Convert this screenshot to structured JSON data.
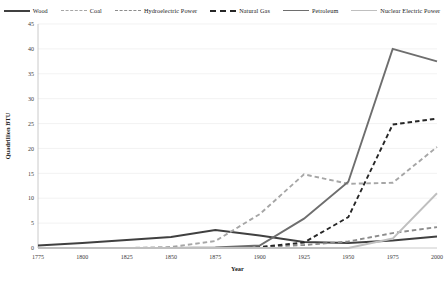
{
  "legend": {
    "items": [
      {
        "label": "Wood",
        "color": "#404040",
        "dash": "none",
        "width": 2
      },
      {
        "label": "Coal",
        "color": "#a6a6a6",
        "dash": "dashed",
        "width": 1.6
      },
      {
        "label": "Hydroelectric Power",
        "color": "#8c8c8c",
        "dash": "dashed",
        "width": 1.6
      },
      {
        "label": "Natural Gas",
        "color": "#262626",
        "dash": "dashed",
        "width": 2.2
      },
      {
        "label": "Petroleum",
        "color": "#6e6e6e",
        "dash": "none",
        "width": 1.8
      },
      {
        "label": "Nuclear Electric Power",
        "color": "#bfbfbf",
        "dash": "none",
        "width": 1.8
      }
    ]
  },
  "axes": {
    "xlabel": "Year",
    "ylabel": "Quadrillion BTU",
    "xticks": [
      "1775",
      "1800",
      "1825",
      "1850",
      "1875",
      "1900",
      "1925",
      "1950",
      "1975",
      "2000"
    ],
    "yticks": [
      "0",
      "5",
      "10",
      "15",
      "20",
      "25",
      "30",
      "35",
      "40",
      "45"
    ]
  },
  "caption": {
    "text": ""
  },
  "chart_data": {
    "type": "line",
    "title": "",
    "xlabel": "Year",
    "ylabel": "Quadrillion BTU",
    "xlim": [
      1775,
      2000
    ],
    "ylim": [
      0,
      45
    ],
    "grid": true,
    "legend_position": "top",
    "x": [
      1775,
      1800,
      1825,
      1850,
      1875,
      1900,
      1925,
      1950,
      1975,
      2000
    ],
    "series": [
      {
        "name": "Wood",
        "color": "#404040",
        "dash": "none",
        "values": [
          0.5,
          1.0,
          1.6,
          2.2,
          3.6,
          2.5,
          1.2,
          1.0,
          1.5,
          2.3
        ]
      },
      {
        "name": "Coal",
        "color": "#a6a6a6",
        "dash": "dashed",
        "values": [
          0.0,
          0.0,
          0.0,
          0.2,
          1.4,
          6.8,
          14.8,
          12.9,
          13.1,
          20.3
        ]
      },
      {
        "name": "Hydroelectric Power",
        "color": "#8c8c8c",
        "dash": "dashed",
        "values": [
          0.0,
          0.0,
          0.0,
          0.0,
          0.0,
          0.2,
          0.6,
          1.3,
          3.0,
          4.2
        ]
      },
      {
        "name": "Natural Gas",
        "color": "#262626",
        "dash": "dashed",
        "values": [
          0.0,
          0.0,
          0.0,
          0.0,
          0.0,
          0.2,
          1.1,
          6.2,
          24.8,
          26.0
        ]
      },
      {
        "name": "Petroleum",
        "color": "#6e6e6e",
        "dash": "none",
        "values": [
          0.0,
          0.0,
          0.0,
          0.0,
          0.1,
          0.5,
          5.9,
          13.3,
          40.0,
          37.5
        ]
      },
      {
        "name": "Nuclear Electric Power",
        "color": "#bfbfbf",
        "dash": "none",
        "values": [
          0.0,
          0.0,
          0.0,
          0.0,
          0.0,
          0.0,
          0.0,
          0.0,
          1.9,
          11.0
        ]
      }
    ]
  }
}
